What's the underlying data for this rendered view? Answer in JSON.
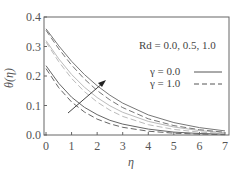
{
  "chart_data": {
    "type": "line",
    "title": "",
    "xlabel": "η",
    "ylabel": "θ(η)",
    "xlim": [
      0,
      7
    ],
    "ylim": [
      0.0,
      0.4
    ],
    "xticks": [
      "0",
      "1",
      "2",
      "3",
      "4",
      "5",
      "6",
      "7"
    ],
    "yticks": [
      "0.0",
      "0.1",
      "0.2",
      "0.3",
      "0.4"
    ],
    "grid": false,
    "annotation": "Rd = 0.0, 0.5, 1.0",
    "arrow_direction": "increasing Rd",
    "legend": [
      {
        "label": "γ = 0.0",
        "style": "solid"
      },
      {
        "label": "γ = 1.0",
        "style": "dashed"
      }
    ],
    "legend_position": "upper right (inside)",
    "x": [
      0,
      0.5,
      1,
      1.5,
      2,
      2.5,
      3,
      4,
      5,
      6,
      7
    ],
    "series": [
      {
        "name": "Rd = 0.0, γ = 0.0",
        "style": "solid",
        "color": "#666666",
        "values": [
          0.235,
          0.175,
          0.128,
          0.094,
          0.069,
          0.05,
          0.037,
          0.02,
          0.01,
          0.005,
          0.003
        ]
      },
      {
        "name": "Rd = 0.0, γ = 1.0",
        "style": "dashed",
        "color": "#666666",
        "values": [
          0.225,
          0.16,
          0.112,
          0.078,
          0.054,
          0.038,
          0.026,
          0.013,
          0.006,
          0.003,
          0.001
        ]
      },
      {
        "name": "Rd = 0.5, γ = 0.0",
        "style": "solid",
        "color": "#bbbbbb",
        "values": [
          0.32,
          0.258,
          0.205,
          0.162,
          0.127,
          0.099,
          0.077,
          0.046,
          0.027,
          0.015,
          0.008
        ]
      },
      {
        "name": "Rd = 0.5, γ = 1.0",
        "style": "dashed",
        "color": "#bbbbbb",
        "values": [
          0.315,
          0.248,
          0.192,
          0.147,
          0.112,
          0.084,
          0.063,
          0.035,
          0.019,
          0.01,
          0.005
        ]
      },
      {
        "name": "Rd = 1.0, γ = 0.0",
        "style": "solid",
        "color": "#777777",
        "values": [
          0.36,
          0.302,
          0.25,
          0.205,
          0.167,
          0.135,
          0.108,
          0.068,
          0.042,
          0.025,
          0.014
        ]
      },
      {
        "name": "Rd = 1.0, γ = 1.0",
        "style": "dashed",
        "color": "#777777",
        "values": [
          0.355,
          0.292,
          0.237,
          0.19,
          0.151,
          0.119,
          0.093,
          0.055,
          0.032,
          0.018,
          0.009
        ]
      }
    ]
  }
}
